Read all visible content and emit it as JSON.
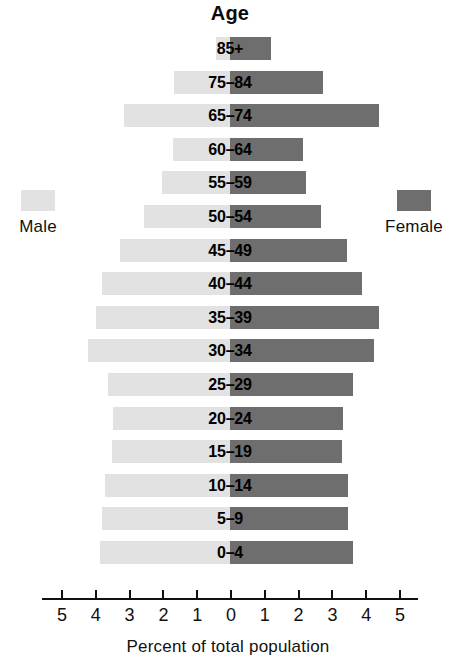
{
  "chart_data": {
    "type": "bar",
    "subtype": "population-pyramid",
    "title": "Age",
    "xlabel": "Percent of total population",
    "ylabel": "Age",
    "grid": false,
    "legend_position": "outside-left-and-right",
    "xlim": [
      -5,
      5
    ],
    "xtick_labels": [
      "5",
      "4",
      "3",
      "2",
      "1",
      "0",
      "1",
      "2",
      "3",
      "4",
      "5"
    ],
    "xtick_values": [
      -5,
      -4,
      -3,
      -2,
      -1,
      0,
      1,
      2,
      3,
      4,
      5
    ],
    "categories": [
      "85+",
      "75–84",
      "65–74",
      "60–64",
      "55–59",
      "50–54",
      "45–49",
      "40–44",
      "35–39",
      "30–34",
      "25–29",
      "20–24",
      "15–19",
      "10–14",
      "5–9",
      "0–4"
    ],
    "series": [
      {
        "name": "Male",
        "side": "left",
        "color": "#e2e2e2",
        "values": [
          0.4,
          1.65,
          3.15,
          1.7,
          2.0,
          2.55,
          3.25,
          3.8,
          3.95,
          4.2,
          3.6,
          3.45,
          3.5,
          3.7,
          3.8,
          3.85
        ]
      },
      {
        "name": "Female",
        "side": "right",
        "color": "#6e6e6e",
        "values": [
          1.2,
          2.75,
          4.4,
          2.15,
          2.25,
          2.7,
          3.45,
          3.9,
          4.4,
          4.25,
          3.65,
          3.35,
          3.3,
          3.5,
          3.5,
          3.65
        ]
      }
    ]
  },
  "legend": {
    "male": {
      "label": "Male",
      "color": "#e2e2e2"
    },
    "female": {
      "label": "Female",
      "color": "#6e6e6e"
    }
  },
  "axis": {
    "caption": "Percent of total population"
  }
}
